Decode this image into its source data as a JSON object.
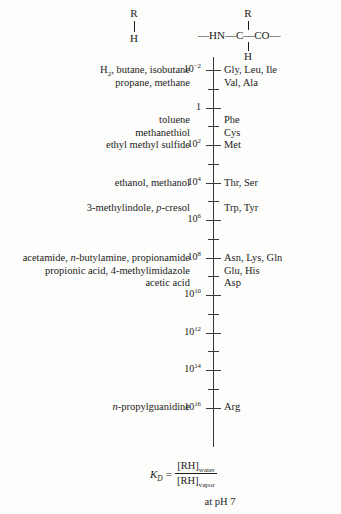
{
  "figure": {
    "background_color": "#fdfdfb",
    "text_color": "#1c1c1c",
    "axis_color": "#3a3a3a"
  },
  "structures": {
    "left": {
      "name": "model-compound-structure",
      "top_atom": "R",
      "bond": "vertical-single-bond",
      "bottom_atom": "H"
    },
    "right": {
      "name": "peptide-backbone-structure",
      "top_atom": "R",
      "bottom_atom": "H",
      "backbone": "—HN—C—CO—",
      "backbone_left": "—HN—",
      "backbone_center": "C",
      "backbone_right": "—CO—"
    }
  },
  "axis": {
    "name": "log-partition-coefficient-axis",
    "orientation": "vertical",
    "scale": "log10",
    "min_exponent": -2,
    "max_exponent": 16,
    "major_step_exponent": 2,
    "minor_ticks_between": 1,
    "major_labels": [
      {
        "exponent": -2,
        "text": "10",
        "sup": "−2"
      },
      {
        "exponent": 0,
        "text": "1",
        "sup": ""
      },
      {
        "exponent": 2,
        "text": "10",
        "sup": "2"
      },
      {
        "exponent": 4,
        "text": "10",
        "sup": "4"
      },
      {
        "exponent": 6,
        "text": "10",
        "sup": "6"
      },
      {
        "exponent": 8,
        "text": "10",
        "sup": "8"
      },
      {
        "exponent": 10,
        "text": "10",
        "sup": "10"
      },
      {
        "exponent": 12,
        "text": "10",
        "sup": "12"
      },
      {
        "exponent": 14,
        "text": "10",
        "sup": "14"
      },
      {
        "exponent": 16,
        "text": "10",
        "sup": "16"
      }
    ]
  },
  "chart_data": {
    "type": "scatter",
    "xlabel": "",
    "ylabel": "K_D = [RH]water / [RH]vapor",
    "axis_scale": "log10",
    "ylim": [
      -2,
      16
    ],
    "grid": false,
    "legend": "none",
    "annotations": [
      {
        "exponent": -2,
        "side": "left",
        "text": "H2, butane, isobutane propane, methane"
      },
      {
        "exponent": -2,
        "side": "right",
        "text": "Gly, Leu, Ile Val, Ala"
      },
      {
        "exponent": 1,
        "side": "left",
        "text": "toluene methanethiol ethyl methyl sulfide"
      },
      {
        "exponent": 1,
        "side": "right",
        "text": "Phe Cys Met"
      },
      {
        "exponent": 4,
        "side": "left",
        "text": "ethanol, methanol"
      },
      {
        "exponent": 4,
        "side": "right",
        "text": "Thr, Ser"
      },
      {
        "exponent": 5,
        "side": "left",
        "text": "3-methylindole, p-cresol"
      },
      {
        "exponent": 5,
        "side": "right",
        "text": "Trp, Tyr"
      },
      {
        "exponent": 8,
        "side": "left",
        "text": "acetamide, n-butylamine, propionamide propionic acid, 4-methylimidazole acetic acid"
      },
      {
        "exponent": 8,
        "side": "right",
        "text": "Asn, Lys, Gln Glu, His Asp"
      },
      {
        "exponent": 14,
        "side": "left",
        "text": "n-propylguanidine"
      },
      {
        "exponent": 14,
        "side": "right",
        "text": "Arg"
      }
    ]
  },
  "left_labels": [
    {
      "name": "compound-group-alkanes",
      "top_px": 64,
      "lines_html": [
        "H<sub>2</sub>, butane, isobutane",
        "propane, methane"
      ],
      "lines_text": [
        "H2, butane, isobutane",
        "propane, methane"
      ]
    },
    {
      "name": "compound-group-aromatics-thiols",
      "top_px": 114,
      "lines_html": [
        "toluene",
        "methanethiol",
        "ethyl methyl sulfide"
      ],
      "lines_text": [
        "toluene",
        "methanethiol",
        "ethyl methyl sulfide"
      ]
    },
    {
      "name": "compound-group-alcohols",
      "top_px": 177,
      "lines_html": [
        "ethanol, methanol"
      ],
      "lines_text": [
        "ethanol, methanol"
      ]
    },
    {
      "name": "compound-group-indole-cresol",
      "top_px": 202,
      "lines_html": [
        "3-methylindole, <i>p</i>-cresol"
      ],
      "lines_text": [
        "3-methylindole, p-cresol"
      ]
    },
    {
      "name": "compound-group-amides-acids",
      "top_px": 252,
      "lines_html": [
        "acetamide, <i>n</i>-butylamine, propionamide",
        "propionic acid, 4-methylimidazole",
        "acetic acid"
      ],
      "lines_text": [
        "acetamide, n-butylamine, propionamide",
        "propionic acid, 4-methylimidazole",
        "acetic acid"
      ]
    },
    {
      "name": "compound-group-guanidine",
      "top_px": 401,
      "lines_html": [
        "<i>n</i>-propylguanidine"
      ],
      "lines_text": [
        "n-propylguanidine"
      ]
    }
  ],
  "right_labels": [
    {
      "name": "amino-acid-group-nonpolar",
      "top_px": 64,
      "lines": [
        "Gly, Leu, Ile",
        "Val, Ala"
      ]
    },
    {
      "name": "amino-acid-group-aromatic-sulfur",
      "top_px": 114,
      "lines": [
        "Phe",
        "Cys",
        "Met"
      ]
    },
    {
      "name": "amino-acid-group-hydroxyl",
      "top_px": 177,
      "lines": [
        "Thr, Ser"
      ]
    },
    {
      "name": "amino-acid-group-trp-tyr",
      "top_px": 202,
      "lines": [
        "Trp, Tyr"
      ]
    },
    {
      "name": "amino-acid-group-charged-polar",
      "top_px": 252,
      "lines": [
        "Asn, Lys, Gln",
        "Glu, His",
        "Asp"
      ]
    },
    {
      "name": "amino-acid-group-arginine",
      "top_px": 401,
      "lines": [
        "Arg"
      ]
    }
  ],
  "equation": {
    "name": "partition-coefficient-equation",
    "symbol": "K",
    "symbol_sub": "D",
    "equals": "=",
    "numerator": "[RH]",
    "numerator_sub": "water",
    "denominator": "[RH]",
    "denominator_sub": "vapor",
    "note": "at pH 7"
  }
}
